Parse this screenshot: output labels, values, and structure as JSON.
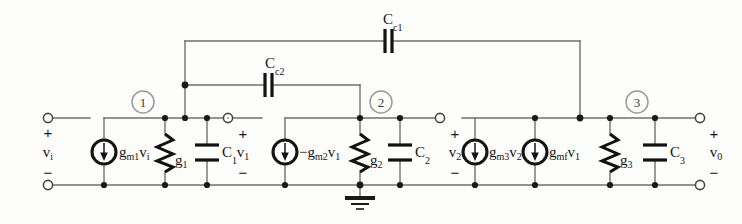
{
  "figure": {
    "kind": "small-signal-equivalent-circuit",
    "title": "",
    "background_color": "#fdfdfc",
    "wire_color": "#6f6f6f",
    "ink_color": "#141414",
    "node_marker_color": "#9a9a9a"
  },
  "ports": {
    "input": {
      "label": "v",
      "sub": "i",
      "plus": "+",
      "minus": "−"
    },
    "mid1": {
      "label": "v",
      "sub": "1",
      "plus": "+",
      "minus": "−"
    },
    "mid2": {
      "label": "v",
      "sub": "2",
      "plus": "+",
      "minus": "−"
    },
    "output": {
      "label": "v",
      "sub": "0",
      "plus": "+",
      "minus": "−"
    }
  },
  "node_markers": [
    {
      "id": "node-1",
      "text": "1"
    },
    {
      "id": "node-2",
      "text": "2"
    },
    {
      "id": "node-3",
      "text": "3"
    }
  ],
  "sources": [
    {
      "id": "src-gm1vi",
      "prefix": "",
      "g": "g",
      "gsub": "m1",
      "v": "v",
      "vsub": "i"
    },
    {
      "id": "src-gm2v1",
      "prefix": "−",
      "g": "g",
      "gsub": "m2",
      "v": "v",
      "vsub": "1"
    },
    {
      "id": "src-gm3v2",
      "prefix": "",
      "g": "g",
      "gsub": "m3",
      "v": "v",
      "vsub": "2"
    },
    {
      "id": "src-gmfv1",
      "prefix": "",
      "g": "g",
      "gsub": "mf",
      "v": "v",
      "vsub": "1"
    }
  ],
  "conductances": [
    {
      "id": "g1",
      "label": "g",
      "sub": "1"
    },
    {
      "id": "g2",
      "label": "g",
      "sub": "2"
    },
    {
      "id": "g3",
      "label": "g",
      "sub": "3"
    }
  ],
  "capacitors": [
    {
      "id": "c1",
      "label": "C",
      "sub": "1"
    },
    {
      "id": "c2",
      "label": "C",
      "sub": "2"
    },
    {
      "id": "c3",
      "label": "C",
      "sub": "3"
    },
    {
      "id": "cc1",
      "label": "C",
      "sub": "c1"
    },
    {
      "id": "cc2",
      "label": "C",
      "sub": "c2"
    }
  ],
  "ground": {
    "id": "ground-symbol",
    "label": ""
  }
}
